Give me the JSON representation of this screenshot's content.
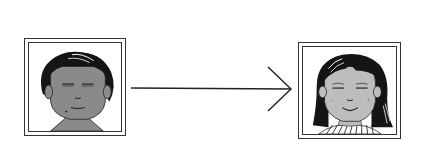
{
  "diagram": {
    "type": "transformation",
    "nodes": [
      {
        "id": "source",
        "label": "",
        "depiction": "short-haired person, dark skin tone, eyes closed, smiling"
      },
      {
        "id": "target",
        "label": "",
        "depiction": "long-haired person, lighter skin tone, eyes closed, smiling"
      }
    ],
    "edges": [
      {
        "from": "source",
        "to": "target",
        "style": "solid-arrow"
      }
    ],
    "colors": {
      "frame": "#333333",
      "hair": "#111111",
      "skin_dark": "#8a8a8a",
      "skin_light": "#bdbdbd",
      "background": "#ffffff"
    }
  }
}
